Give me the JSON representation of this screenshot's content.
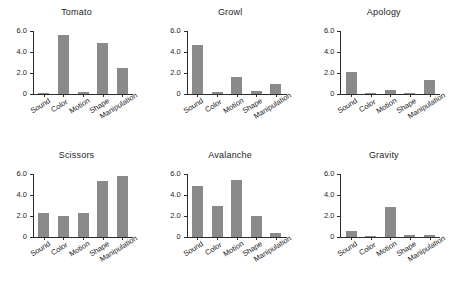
{
  "figure": {
    "layout": "2 rows x 3 columns of small-multiple bar charts",
    "background_color": "#ffffff",
    "bar_color": "#8a8a8a",
    "axis_color": "#2b2b2b"
  },
  "axis": {
    "ytick_labels": [
      "6.0",
      "4.0",
      "2.0",
      "0"
    ],
    "ytick_values": [
      6.0,
      4.0,
      2.0,
      0
    ],
    "ymin": 0,
    "ymax": 6.0
  },
  "categories": [
    "Sound",
    "Color",
    "Motion",
    "Shape",
    "Manipulation"
  ],
  "chart_data": [
    {
      "type": "bar",
      "title": "Tomato",
      "categories": [
        "Sound",
        "Color",
        "Motion",
        "Shape",
        "Manipulation"
      ],
      "values": [
        0.08,
        5.6,
        0.2,
        4.9,
        2.5
      ],
      "xlabel": "",
      "ylabel": "",
      "ylim": [
        0,
        6.0
      ],
      "yticks": [
        0,
        2.0,
        4.0,
        6.0
      ],
      "grid": false,
      "legend": "none"
    },
    {
      "type": "bar",
      "title": "Growl",
      "categories": [
        "Sound",
        "Color",
        "Motion",
        "Shape",
        "Manipulation"
      ],
      "values": [
        4.65,
        0.2,
        1.6,
        0.3,
        0.95
      ],
      "xlabel": "",
      "ylabel": "",
      "ylim": [
        0,
        6.0
      ],
      "yticks": [
        0,
        2.0,
        4.0,
        6.0
      ],
      "grid": false,
      "legend": "none"
    },
    {
      "type": "bar",
      "title": "Apology",
      "categories": [
        "Sound",
        "Color",
        "Motion",
        "Shape",
        "Manipulation"
      ],
      "values": [
        2.1,
        0.05,
        0.35,
        0.1,
        1.3
      ],
      "xlabel": "",
      "ylabel": "",
      "ylim": [
        0,
        6.0
      ],
      "yticks": [
        0,
        2.0,
        4.0,
        6.0
      ],
      "grid": false,
      "legend": "none"
    },
    {
      "type": "bar",
      "title": "Scissors",
      "categories": [
        "Sound",
        "Color",
        "Motion",
        "Shape",
        "Manipulation"
      ],
      "values": [
        2.3,
        2.0,
        2.3,
        5.3,
        5.85
      ],
      "xlabel": "",
      "ylabel": "",
      "ylim": [
        0,
        6.0
      ],
      "yticks": [
        0,
        2.0,
        4.0,
        6.0
      ],
      "grid": false,
      "legend": "none"
    },
    {
      "type": "bar",
      "title": "Avalanche",
      "categories": [
        "Sound",
        "Color",
        "Motion",
        "Shape",
        "Manipulation"
      ],
      "values": [
        4.85,
        3.0,
        5.45,
        2.0,
        0.4
      ],
      "xlabel": "",
      "ylabel": "",
      "ylim": [
        0,
        6.0
      ],
      "yticks": [
        0,
        2.0,
        4.0,
        6.0
      ],
      "grid": false,
      "legend": "none"
    },
    {
      "type": "bar",
      "title": "Gravity",
      "categories": [
        "Sound",
        "Color",
        "Motion",
        "Shape",
        "Manipulation"
      ],
      "values": [
        0.55,
        0.02,
        2.9,
        0.15,
        0.18
      ],
      "xlabel": "",
      "ylabel": "",
      "ylim": [
        0,
        6.0
      ],
      "yticks": [
        0,
        2.0,
        4.0,
        6.0
      ],
      "grid": false,
      "legend": "none"
    }
  ]
}
